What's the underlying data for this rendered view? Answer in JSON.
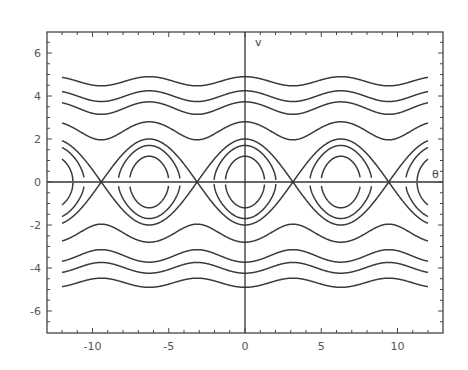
{
  "chart_data": {
    "type": "line",
    "title": "",
    "subtitle": "Phase portrait of a simple pendulum",
    "xlabel": "θ",
    "ylabel": "v",
    "xlim": [
      -13,
      13
    ],
    "ylim": [
      -7,
      7
    ],
    "grid": false,
    "legend": "none",
    "x_ticks": [
      -10,
      -5,
      0,
      5,
      10
    ],
    "y_ticks": [
      -6,
      -4,
      -2,
      0,
      2,
      4,
      6
    ],
    "x_range_curves": [
      -12,
      12
    ],
    "equation": "v^2/2 - cos(theta) = E",
    "series": [
      {
        "name": "closed orbit inner",
        "energy": -0.28,
        "peak_v": 1.2,
        "kind": "libration"
      },
      {
        "name": "closed orbit outer",
        "energy": 0.445,
        "peak_v": 1.7,
        "kind": "libration"
      },
      {
        "name": "separatrix",
        "energy": 1.0,
        "peak_v": 2.0,
        "kind": "separatrix"
      },
      {
        "name": "rotation 1",
        "energy": 2.92,
        "v_min": 2.0,
        "v_max": 2.8,
        "kind": "rotation"
      },
      {
        "name": "rotation 2",
        "energy": 5.95,
        "v_min": 3.15,
        "v_max": 3.7,
        "kind": "rotation"
      },
      {
        "name": "rotation 3",
        "energy": 8.0,
        "v_min": 3.75,
        "v_max": 4.25,
        "kind": "rotation"
      },
      {
        "name": "rotation 4",
        "energy": 11.0,
        "v_min": 4.5,
        "v_max": 4.9,
        "kind": "rotation"
      }
    ]
  },
  "axes": {
    "x_tick_labels": [
      "-10",
      "-5",
      "0",
      "5",
      "10"
    ],
    "y_tick_labels": [
      "6",
      "4",
      "2",
      "0",
      "-2",
      "-4",
      "-6"
    ],
    "x_axis_label": "θ",
    "y_axis_label": "v"
  },
  "style": {
    "curve_color": "#3a3a3a",
    "frame_color": "#444444",
    "background": "#ffffff"
  }
}
